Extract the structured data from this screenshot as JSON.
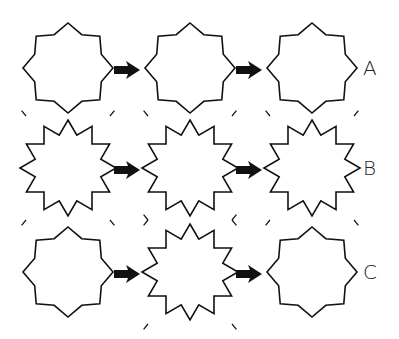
{
  "rows": [
    {
      "label": "A",
      "sequence": [
        "calm",
        "calm",
        "calm"
      ]
    },
    {
      "label": "B",
      "sequence": [
        "burst",
        "burst",
        "burst"
      ]
    },
    {
      "label": "C",
      "sequence": [
        "calm",
        "burst",
        "calm"
      ]
    }
  ],
  "icons": {
    "calm": "star-8-point",
    "burst": "starburst-12-point-with-rays",
    "arrow": "right-arrow"
  },
  "colors": {
    "stroke": "#111111",
    "background": "#ffffff"
  }
}
